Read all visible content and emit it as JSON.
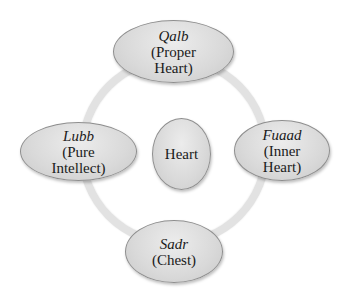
{
  "diagram": {
    "type": "cycle",
    "center": {
      "label": "Heart"
    },
    "nodes": [
      {
        "position": "top",
        "term": "Qalb",
        "meaning_line1": "(Proper",
        "meaning_line2": "Heart)"
      },
      {
        "position": "right",
        "term": "Fuaad",
        "meaning_line1": "(Inner",
        "meaning_line2": "Heart)"
      },
      {
        "position": "bottom",
        "term": "Sadr",
        "meaning_line1": "(Chest)",
        "meaning_line2": ""
      },
      {
        "position": "left",
        "term": "Lubb",
        "meaning_line1": "(Pure",
        "meaning_line2": "Intellect)"
      }
    ],
    "colors": {
      "node_fill": "#d9d9d9",
      "node_border": "#8e8e8e",
      "ring": "#e2e2e2",
      "text": "#1a1a1a",
      "background": "#ffffff"
    }
  }
}
